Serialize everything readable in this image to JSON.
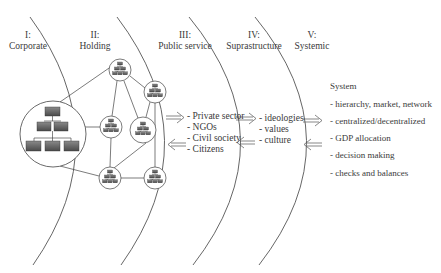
{
  "zones": [
    {
      "numeral": "I:",
      "name": "Corporate"
    },
    {
      "numeral": "II:",
      "name": "Holding"
    },
    {
      "numeral": "III:",
      "name": "Public service"
    },
    {
      "numeral": "IV:",
      "name": "Suprastructure"
    },
    {
      "numeral": "V:",
      "name": "Systemic"
    }
  ],
  "public_service_items": [
    "- Private sector",
    "- NGOs",
    "- Civil society",
    "- Citizens"
  ],
  "suprastructure_items": [
    "- ideologies",
    "- values",
    "- culture"
  ],
  "system": {
    "title": "System",
    "items": [
      "- hierarchy, market, network",
      "- centralized/decentralized",
      "- GDP allocation",
      "- decision making",
      "- checks and balances"
    ]
  },
  "icons": {
    "org_chart": "org-chart-icon",
    "arrow_right": "double-arrow-right-icon",
    "arrow_left": "double-arrow-left-icon"
  },
  "colors": {
    "line": "#555555",
    "box_fill": "#6a6a6a",
    "box_stroke": "#333333",
    "text": "#3a3a3a"
  }
}
